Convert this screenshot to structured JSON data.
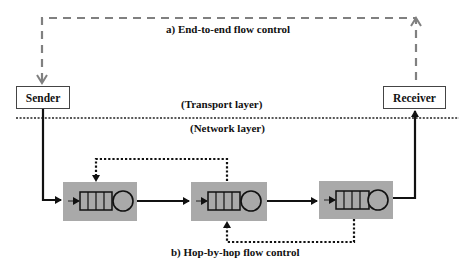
{
  "diagram": {
    "title_top": "a) End-to-end flow control",
    "title_bottom": "b) Hop-by-hop flow control",
    "layer_upper": "(Transport layer)",
    "layer_lower": "(Network layer)",
    "sender": "Sender",
    "receiver": "Receiver",
    "routers": [
      {
        "name": "router-1",
        "x": 63,
        "y": 182,
        "w": 74,
        "h": 39
      },
      {
        "name": "router-2",
        "x": 191,
        "y": 182,
        "w": 76,
        "h": 39
      },
      {
        "name": "router-3",
        "x": 319,
        "y": 181,
        "w": 74,
        "h": 38
      }
    ],
    "colors": {
      "router_fill": "#a9a9a9",
      "end_to_end_line": "#808080",
      "data_path": "#111111",
      "hop_feedback": "#111111"
    }
  }
}
